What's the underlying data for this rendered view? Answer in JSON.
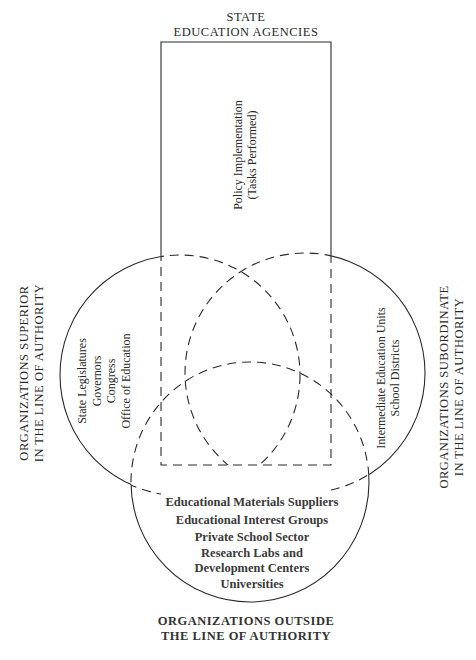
{
  "diagram": {
    "type": "venn-with-rectangle",
    "top_label": [
      "STATE",
      "EDUCATION AGENCIES"
    ],
    "rectangle": {
      "label": [
        "Policy Implementation",
        "(Tasks Performed)"
      ]
    },
    "left_circle": {
      "outer_label": [
        "ORGANIZATIONS SUPERIOR",
        "IN THE LINE OF AUTHORITY"
      ],
      "items": [
        "State Legislatures",
        "Governors",
        "Congress",
        "Office of Education"
      ]
    },
    "right_circle": {
      "outer_label": [
        "ORGANIZATIONS SUBORDINATE",
        "IN THE LINE OF AUTHORITY"
      ],
      "items": [
        "Intermediate Education Units",
        "School Districts"
      ]
    },
    "bottom_circle": {
      "outer_label": [
        "ORGANIZATIONS OUTSIDE",
        "THE LINE OF AUTHORITY"
      ],
      "items": [
        "Educational Materials Suppliers",
        "Educational Interest Groups",
        "Private School Sector",
        "Research Labs and",
        "Development Centers",
        "Universities"
      ]
    },
    "colors": {
      "stroke": "#2a2a2a",
      "background": "#ffffff"
    }
  }
}
